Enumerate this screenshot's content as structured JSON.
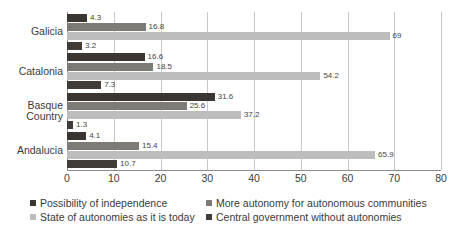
{
  "chart_data": {
    "type": "bar",
    "orientation": "horizontal",
    "title": "",
    "subtitle": "",
    "xlabel": "",
    "ylabel": "",
    "xlim": [
      0,
      80
    ],
    "xticks": [
      0,
      10,
      20,
      30,
      40,
      50,
      60,
      70,
      80
    ],
    "grid": true,
    "grid_axis": "x",
    "legend_position": "bottom",
    "categories": [
      "Galicia",
      "Catalonia",
      "Basque Country",
      "Andalucia"
    ],
    "series": [
      {
        "name": "Possibility of independence",
        "color": "#3b3632",
        "values": [
          4.3,
          16.6,
          31.6,
          4.1
        ],
        "labels": [
          "4.3",
          "16.6",
          "31.6",
          "4.1"
        ]
      },
      {
        "name": "More autonomy for autonomous communities",
        "color": "#7e7a75",
        "values": [
          16.8,
          18.5,
          25.6,
          15.4
        ],
        "labels": [
          "16.8",
          "18.5",
          "25.6",
          "15.4"
        ]
      },
      {
        "name": "State of autonomies as it is today",
        "color": "#bdbdbd",
        "values": [
          69,
          54.2,
          37.2,
          65.9
        ],
        "labels": [
          "69",
          "54.2",
          "37.2",
          "65.9"
        ]
      },
      {
        "name": "Central government without autonomies",
        "color": "#413c38",
        "values": [
          3.2,
          7.3,
          1.3,
          10.7
        ],
        "labels": [
          "3.2",
          "7.3",
          "1.3",
          "10.7"
        ]
      }
    ]
  },
  "axis": {
    "tick_labels": [
      "0",
      "10",
      "20",
      "30",
      "40",
      "50",
      "60",
      "70",
      "80"
    ]
  },
  "category_labels": [
    "Galicia",
    "Catalonia",
    "Basque\nCountry",
    "Andalucia"
  ],
  "legend": {
    "items": [
      {
        "label": "Possibility of independence",
        "color": "#3b3632"
      },
      {
        "label": "More autonomy for autonomous communities",
        "color": "#7e7a75"
      },
      {
        "label": "State of autonomies as it is today",
        "color": "#bdbdbd"
      },
      {
        "label": "Central government without autonomies",
        "color": "#413c38"
      }
    ]
  }
}
